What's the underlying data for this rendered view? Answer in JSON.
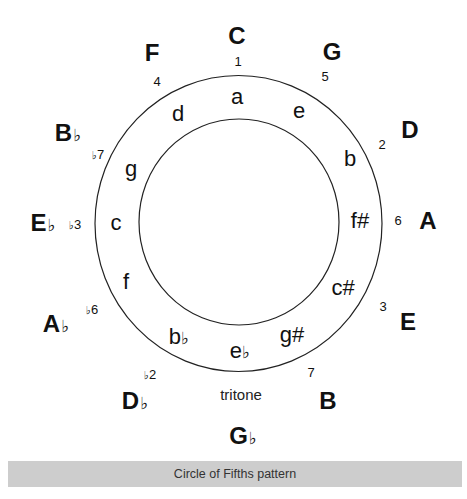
{
  "figure": {
    "caption": "Circle of Fifths pattern",
    "annotation": "tritone",
    "colors": {
      "ink": "#111111",
      "caption_bg": "#cdcdcd",
      "caption_text": "#333333"
    },
    "rings": {
      "outer": {
        "cx": 238.5,
        "cy": 223.5,
        "rx": 143.5,
        "ry": 148
      },
      "inner": {
        "cx": 239,
        "cy": 222,
        "rx": 100,
        "ry": 103
      }
    },
    "major_keys": [
      {
        "root": "C",
        "accidental": "",
        "x": 237,
        "y": 36
      },
      {
        "root": "G",
        "accidental": "",
        "x": 332,
        "y": 52
      },
      {
        "root": "D",
        "accidental": "",
        "x": 410,
        "y": 130
      },
      {
        "root": "A",
        "accidental": "",
        "x": 428,
        "y": 221
      },
      {
        "root": "E",
        "accidental": "",
        "x": 408,
        "y": 322
      },
      {
        "root": "B",
        "accidental": "",
        "x": 328,
        "y": 401
      },
      {
        "root": "G",
        "accidental": "♭",
        "x": 243,
        "y": 436
      },
      {
        "root": "D",
        "accidental": "♭",
        "x": 135,
        "y": 401
      },
      {
        "root": "A",
        "accidental": "♭",
        "x": 56,
        "y": 324
      },
      {
        "root": "E",
        "accidental": "♭",
        "x": 43,
        "y": 223
      },
      {
        "root": "B",
        "accidental": "♭",
        "x": 68,
        "y": 133
      },
      {
        "root": "F",
        "accidental": "",
        "x": 152,
        "y": 53
      }
    ],
    "degrees": [
      {
        "label": "1",
        "accidental": "",
        "x": 238,
        "y": 61
      },
      {
        "label": "5",
        "accidental": "",
        "x": 325,
        "y": 76
      },
      {
        "label": "2",
        "accidental": "",
        "x": 382,
        "y": 144
      },
      {
        "label": "6",
        "accidental": "",
        "x": 398,
        "y": 220
      },
      {
        "label": "3",
        "accidental": "",
        "x": 383,
        "y": 306
      },
      {
        "label": "7",
        "accidental": "",
        "x": 311,
        "y": 372
      },
      {
        "label": "2",
        "accidental": "♭",
        "x": 150,
        "y": 374
      },
      {
        "label": "6",
        "accidental": "♭",
        "x": 92,
        "y": 309
      },
      {
        "label": "3",
        "accidental": "♭",
        "x": 75,
        "y": 224
      },
      {
        "label": "7",
        "accidental": "♭",
        "x": 98,
        "y": 154
      },
      {
        "label": "4",
        "accidental": "",
        "x": 157,
        "y": 81
      }
    ],
    "minor_keys": [
      {
        "root": "a",
        "accidental": "",
        "x": 237,
        "y": 97
      },
      {
        "root": "e",
        "accidental": "",
        "x": 299,
        "y": 111
      },
      {
        "root": "b",
        "accidental": "",
        "x": 350,
        "y": 159
      },
      {
        "root": "f#",
        "accidental": "",
        "x": 360,
        "y": 221
      },
      {
        "root": "c#",
        "accidental": "",
        "x": 343,
        "y": 288
      },
      {
        "root": "g#",
        "accidental": "",
        "x": 292,
        "y": 335
      },
      {
        "root": "e",
        "accidental": "♭",
        "x": 240,
        "y": 351
      },
      {
        "root": "b",
        "accidental": "♭",
        "x": 179,
        "y": 337
      },
      {
        "root": "f",
        "accidental": "",
        "x": 126,
        "y": 282
      },
      {
        "root": "c",
        "accidental": "",
        "x": 116,
        "y": 223
      },
      {
        "root": "g",
        "accidental": "",
        "x": 131,
        "y": 169
      },
      {
        "root": "d",
        "accidental": "",
        "x": 178,
        "y": 114
      }
    ],
    "tritone_label": {
      "x": 241,
      "y": 394
    }
  }
}
